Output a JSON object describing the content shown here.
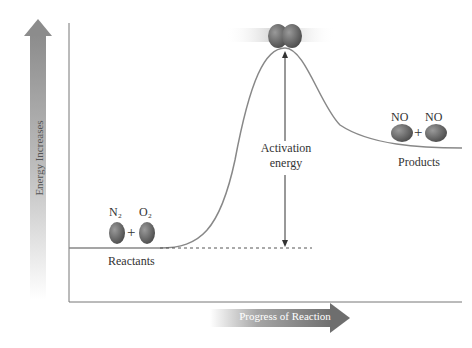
{
  "diagram": {
    "title": "",
    "y_axis_label": "Energy Increases",
    "x_axis_label": "Progress of Reaction",
    "reactants": {
      "formula_1": "N₂",
      "formula_2": "O₂",
      "plus": "+",
      "label": "Reactants"
    },
    "products": {
      "formula_1": "NO",
      "formula_2": "NO",
      "plus": "+",
      "label": "Products"
    },
    "activation_energy": {
      "line1": "Activation",
      "line2": "energy"
    },
    "colors": {
      "axis_line": "#666666",
      "curve": "#888888",
      "arrow_fill": "#8a8a8a",
      "molecule": "#6e6e6e"
    }
  }
}
